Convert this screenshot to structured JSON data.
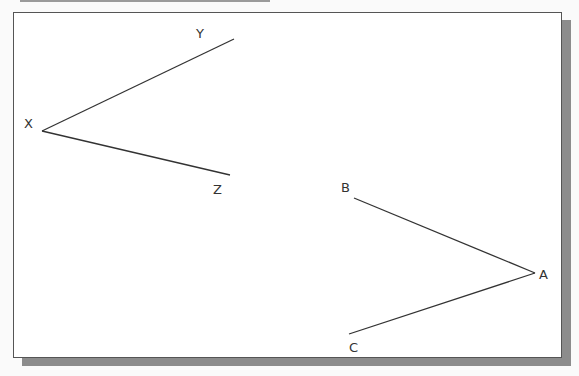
{
  "diagram": {
    "angle1": {
      "vertex": {
        "label": "X",
        "x": 42,
        "y": 131
      },
      "ray1": {
        "label": "Y",
        "x": 234,
        "y": 39
      },
      "ray2": {
        "label": "Z",
        "x": 230,
        "y": 175
      }
    },
    "angle2": {
      "vertex": {
        "label": "A",
        "x": 535,
        "y": 273
      },
      "ray1": {
        "label": "B",
        "x": 354,
        "y": 198
      },
      "ray2": {
        "label": "C",
        "x": 349,
        "y": 334
      }
    },
    "colors": {
      "line": "#333333",
      "frame": "#555555",
      "shadow": "#8c8c8c",
      "background": "#ffffff"
    }
  }
}
